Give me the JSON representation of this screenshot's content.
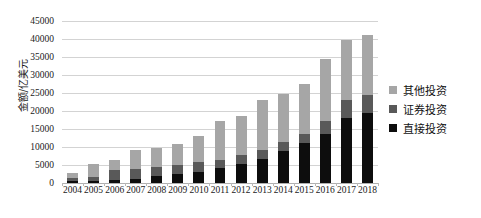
{
  "chart_data": {
    "type": "bar",
    "stacked": true,
    "title": "",
    "xlabel": "",
    "ylabel": "金额/亿美元",
    "ylim": [
      0,
      45000
    ],
    "ytick_step": 5000,
    "yticks": [
      "0",
      "5000",
      "10000",
      "15000",
      "20000",
      "25000",
      "30000",
      "35000",
      "40000",
      "45000"
    ],
    "grid": true,
    "legend_position": "right",
    "categories": [
      "2004",
      "2005",
      "2006",
      "2007",
      "2008",
      "2009",
      "2010",
      "2011",
      "2012",
      "2013",
      "2014",
      "2015",
      "2016",
      "2017",
      "2018"
    ],
    "series": [
      {
        "name": "直接投资",
        "color": "#0d0d0d",
        "values": [
          530,
          640,
          900,
          1180,
          1840,
          2460,
          3170,
          4250,
          5320,
          6600,
          8830,
          10980,
          13570,
          18090,
          19396
        ]
      },
      {
        "name": "证券投资",
        "color": "#595959",
        "values": [
          920,
          1160,
          2650,
          2850,
          2530,
          2430,
          2570,
          2040,
          2410,
          2590,
          2630,
          2610,
          3700,
          4970,
          4979
        ]
      },
      {
        "name": "其他投资",
        "color": "#a6a6a6",
        "values": [
          1400,
          3400,
          2800,
          5200,
          5500,
          6000,
          7300,
          11000,
          10800,
          13800,
          13400,
          13900,
          17100,
          16600,
          16700
        ]
      }
    ],
    "totals": [
      2850,
      5200,
      6350,
      9230,
      9870,
      10890,
      13040,
      17290,
      18530,
      22990,
      24860,
      27490,
      34370,
      39660,
      41075
    ]
  }
}
